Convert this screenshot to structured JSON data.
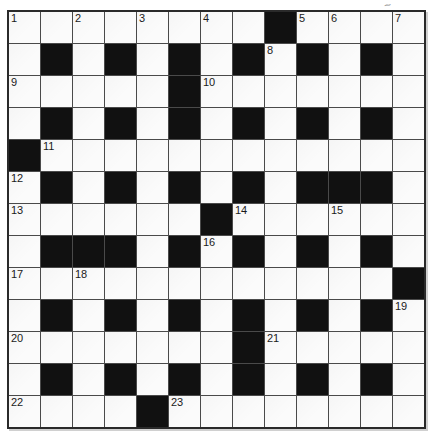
{
  "page": {
    "kind": "crossword-puzzle-grid",
    "artifact_mark": "~"
  },
  "colors": {
    "black_cell": "#111111",
    "white_cell": "#fbfbfb",
    "grid_line": "#4a4a4a",
    "outer_border": "#2a2a2a",
    "number_color": "#1a1a1a",
    "page_bg": "#ffffff"
  },
  "grid": {
    "rows": 13,
    "cols": 13,
    "cells": [
      "........#....",
      ".#.#.#.#.#.#.",
      ".....#.......",
      ".#.#.#.#.#.#.",
      "#............",
      ".#.#.#.#.###.",
      "......#......",
      ".###.#.#.#.#.",
      "............#",
      ".#.#.#.#.#.#.",
      ".......#.....",
      ".#.#.#.#.#.#.",
      "....#........"
    ],
    "numbers": [
      {
        "row": 0,
        "col": 0,
        "label": "1"
      },
      {
        "row": 0,
        "col": 2,
        "label": "2"
      },
      {
        "row": 0,
        "col": 4,
        "label": "3"
      },
      {
        "row": 0,
        "col": 6,
        "label": "4"
      },
      {
        "row": 0,
        "col": 9,
        "label": "5"
      },
      {
        "row": 0,
        "col": 10,
        "label": "6"
      },
      {
        "row": 0,
        "col": 12,
        "label": "7"
      },
      {
        "row": 1,
        "col": 8,
        "label": "8"
      },
      {
        "row": 2,
        "col": 0,
        "label": "9"
      },
      {
        "row": 2,
        "col": 6,
        "label": "10"
      },
      {
        "row": 4,
        "col": 1,
        "label": "11"
      },
      {
        "row": 5,
        "col": 0,
        "label": "12"
      },
      {
        "row": 6,
        "col": 0,
        "label": "13"
      },
      {
        "row": 6,
        "col": 7,
        "label": "14"
      },
      {
        "row": 6,
        "col": 10,
        "label": "15"
      },
      {
        "row": 7,
        "col": 6,
        "label": "16"
      },
      {
        "row": 8,
        "col": 0,
        "label": "17"
      },
      {
        "row": 8,
        "col": 2,
        "label": "18"
      },
      {
        "row": 9,
        "col": 12,
        "label": "19"
      },
      {
        "row": 10,
        "col": 0,
        "label": "20"
      },
      {
        "row": 10,
        "col": 8,
        "label": "21"
      },
      {
        "row": 12,
        "col": 0,
        "label": "22"
      },
      {
        "row": 12,
        "col": 5,
        "label": "23"
      }
    ]
  }
}
